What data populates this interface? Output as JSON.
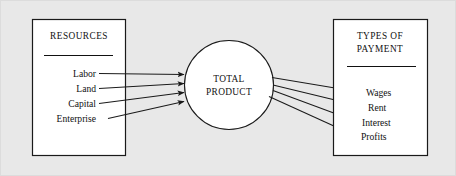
{
  "diagram": {
    "background_color": "#e8e8e8",
    "box_fill_color": "#ffffff",
    "line_color": "#1a1a1a",
    "left_panel": {
      "heading": "RESOURCES",
      "items": [
        {
          "label": "Labor"
        },
        {
          "label": "Land"
        },
        {
          "label": "Capital"
        },
        {
          "label": "Enterprise"
        }
      ]
    },
    "center_node": {
      "line1": "TOTAL",
      "line2": "PRODUCT"
    },
    "right_panel": {
      "heading_line1": "TYPES OF",
      "heading_line2": "PAYMENT",
      "items": [
        {
          "label": "Wages"
        },
        {
          "label": "Rent"
        },
        {
          "label": "Interest"
        },
        {
          "label": "Profits"
        }
      ]
    }
  }
}
